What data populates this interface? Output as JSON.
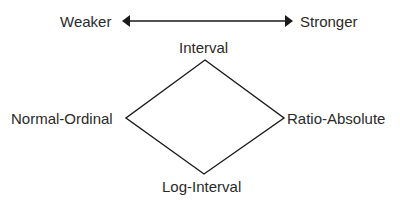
{
  "scale": {
    "weak_label": "Weaker",
    "strong_label": "Stronger"
  },
  "diamond": {
    "top_label": "Interval",
    "left_label": "Normal-Ordinal",
    "right_label": "Ratio-Absolute",
    "bottom_label": "Log-Interval"
  },
  "colors": {
    "line": "#1a1a1a",
    "text": "#2a2a2a"
  }
}
